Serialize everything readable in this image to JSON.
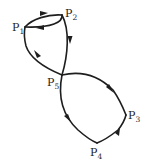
{
  "diagram": {
    "type": "directed-graph",
    "nodes": [
      {
        "id": "P1",
        "base": "P",
        "sub": "1"
      },
      {
        "id": "P2",
        "base": "P",
        "sub": "2"
      },
      {
        "id": "P3",
        "base": "P",
        "sub": "3"
      },
      {
        "id": "P4",
        "base": "P",
        "sub": "4"
      },
      {
        "id": "P5",
        "base": "P",
        "sub": "5"
      }
    ],
    "edges": [
      {
        "from": "P1",
        "to": "P2"
      },
      {
        "from": "P2",
        "to": "P1"
      },
      {
        "from": "P2",
        "to": "P5"
      },
      {
        "from": "P5",
        "to": "P1"
      },
      {
        "from": "P5",
        "to": "P3"
      },
      {
        "from": "P4",
        "to": "P3"
      },
      {
        "from": "P5",
        "to": "P4"
      }
    ],
    "colors": {
      "stroke": "#1e1e1e",
      "background": "#ffffff"
    }
  }
}
